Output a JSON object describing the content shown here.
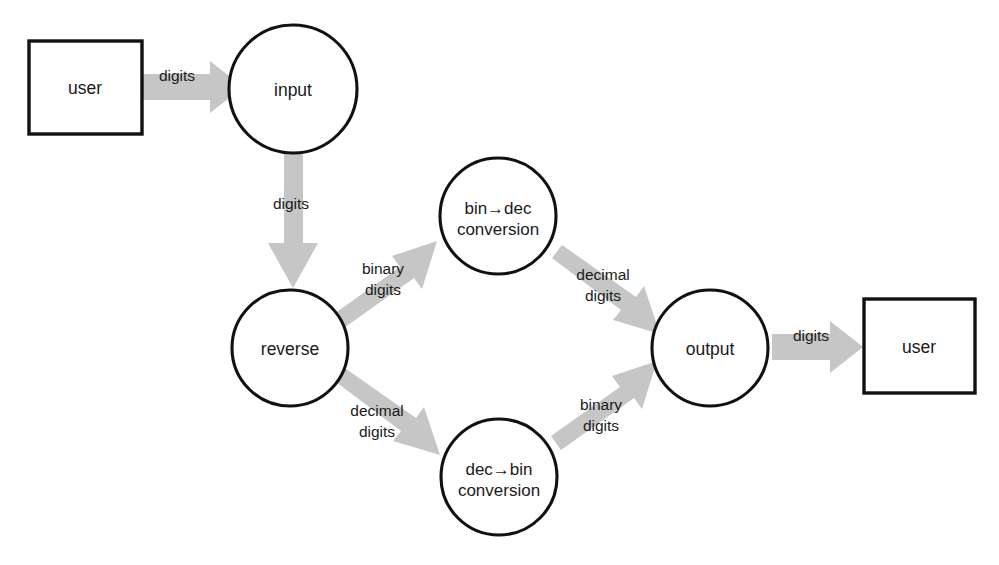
{
  "diagram": {
    "type": "data-flow-diagram",
    "title": "",
    "background_color": "#ffffff",
    "node_stroke_color": "#111111",
    "node_fill_color": "#ffffff",
    "arrow_color": "#c6c6c6",
    "text_color": "#1a1a1a",
    "nodes": [
      {
        "id": "user_left",
        "label": "user",
        "shape": "rectangle",
        "x": 29,
        "y": 41,
        "width": 113,
        "height": 93,
        "cx": 85,
        "cy": 87
      },
      {
        "id": "input",
        "label": "input",
        "shape": "circle",
        "cx": 293,
        "cy": 89,
        "r": 64
      },
      {
        "id": "reverse",
        "label": "reverse",
        "shape": "circle",
        "cx": 290,
        "cy": 348,
        "r": 58
      },
      {
        "id": "bin_to_dec",
        "label_line1": "bin→dec",
        "label_line2": "conversion",
        "shape": "circle",
        "cx": 498,
        "cy": 216,
        "r": 58
      },
      {
        "id": "dec_to_bin",
        "label_line1": "dec→bin",
        "label_line2": "conversion",
        "shape": "circle",
        "cx": 499,
        "cy": 477,
        "r": 58
      },
      {
        "id": "output",
        "label": "output",
        "shape": "circle",
        "cx": 710,
        "cy": 348,
        "r": 58
      },
      {
        "id": "user_right",
        "label": "user",
        "shape": "rectangle",
        "x": 864,
        "y": 299,
        "width": 111,
        "height": 94,
        "cx": 919,
        "cy": 346
      }
    ],
    "edges": [
      {
        "id": "edge_user_input",
        "from": "user_left",
        "to": "input",
        "label": "digits",
        "label_x": 177,
        "label_y": 81,
        "direction": "right"
      },
      {
        "id": "edge_input_reverse",
        "from": "input",
        "to": "reverse",
        "label": "digits",
        "label_x": 291,
        "label_y": 209,
        "direction": "down"
      },
      {
        "id": "edge_reverse_bindec",
        "from": "reverse",
        "to": "bin_to_dec",
        "label_line1": "binary",
        "label_line2": "digits",
        "label_x": 383,
        "label_y": 274,
        "direction": "up-right"
      },
      {
        "id": "edge_bindec_output",
        "from": "bin_to_dec",
        "to": "output",
        "label_line1": "decimal",
        "label_line2": "digits",
        "label_x": 603,
        "label_y": 280,
        "direction": "down-right"
      },
      {
        "id": "edge_reverse_decbin",
        "from": "reverse",
        "to": "dec_to_bin",
        "label_line1": "decimal",
        "label_line2": "digits",
        "label_x": 377,
        "label_y": 416,
        "direction": "down-right"
      },
      {
        "id": "edge_decbin_output",
        "from": "dec_to_bin",
        "to": "output",
        "label_line1": "binary",
        "label_line2": "digits",
        "label_x": 601,
        "label_y": 410,
        "direction": "up-right"
      },
      {
        "id": "edge_output_user",
        "from": "output",
        "to": "user_right",
        "label": "digits",
        "label_x": 811,
        "label_y": 341,
        "direction": "right"
      }
    ]
  }
}
